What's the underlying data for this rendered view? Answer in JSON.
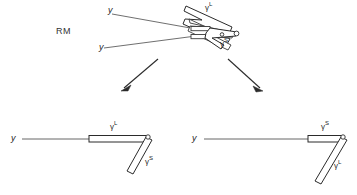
{
  "figure": {
    "type": "schematic-diagram",
    "background_color": "#ffffff",
    "line_color": "#2b2b2b",
    "width": 357,
    "height": 195
  },
  "top_panel": {
    "name": "RM",
    "state_label": "RM",
    "strand_labels": {
      "y_upper": "y",
      "y_lower": "y"
    },
    "rod_labels": {
      "long": "γ",
      "long_sup": "L",
      "short": "γ",
      "short_sup": "S"
    }
  },
  "transitions": {
    "left_arrow": "arrow-down-left",
    "right_arrow": "arrow-down-right"
  },
  "bottom_left_panel": {
    "name": "conformation-left",
    "strand_label": "y",
    "horizontal_rod": {
      "base": "γ",
      "sup": "L"
    },
    "diagonal_rod": {
      "base": "γ",
      "sup": "S"
    }
  },
  "bottom_right_panel": {
    "name": "conformation-right",
    "strand_label": "y",
    "horizontal_rod": {
      "base": "γ",
      "sup": "S"
    },
    "diagonal_rod": {
      "base": "γ",
      "sup": "L"
    }
  }
}
